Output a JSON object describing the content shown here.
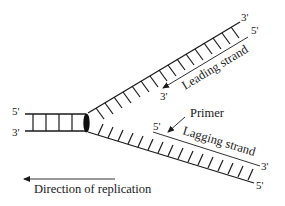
{
  "figure": {
    "colors": {
      "ink": "#1a1a1a",
      "background": "#ffffff"
    }
  },
  "parent_duplex": {
    "top_label": "5'",
    "bottom_label": "3'",
    "rungs": 4
  },
  "leading": {
    "template_end_label": "3'",
    "new_strand_start_label": "5'",
    "new_strand_end_label": "3'",
    "strand_label": "Leading strand",
    "rungs": 17
  },
  "lagging": {
    "new_strand_start_label": "5'",
    "new_strand_end_label": "3'",
    "template_end_label": "5'",
    "strand_label": "Lagging strand",
    "primer_label": "Primer",
    "rungs": 17
  },
  "direction": {
    "label": "Direction of replication",
    "arrow": "left"
  }
}
